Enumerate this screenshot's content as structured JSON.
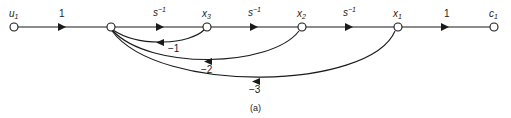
{
  "diagram": {
    "type": "signal-flow-graph",
    "caption": "(a)",
    "nodes": [
      {
        "id": "u1",
        "label": "u",
        "sub": "1",
        "x": 14,
        "y": 27
      },
      {
        "id": "n0",
        "label": "",
        "sub": "",
        "x": 111,
        "y": 27
      },
      {
        "id": "x3",
        "label": "x",
        "sub": "3",
        "x": 207,
        "y": 27
      },
      {
        "id": "x2",
        "label": "x",
        "sub": "2",
        "x": 302,
        "y": 27
      },
      {
        "id": "x1",
        "label": "x",
        "sub": "1",
        "x": 398,
        "y": 27
      },
      {
        "id": "c1",
        "label": "c",
        "sub": "1",
        "x": 494,
        "y": 27
      }
    ],
    "forward_edges": [
      {
        "from": "u1",
        "to": "n0",
        "gain": "1"
      },
      {
        "from": "n0",
        "to": "x3",
        "gain": "s",
        "gain_sup": "−1"
      },
      {
        "from": "x3",
        "to": "x2",
        "gain": "s",
        "gain_sup": "−1"
      },
      {
        "from": "x2",
        "to": "x1",
        "gain": "s",
        "gain_sup": "−1"
      },
      {
        "from": "x1",
        "to": "c1",
        "gain": "1"
      }
    ],
    "feedback_edges": [
      {
        "from": "x3",
        "to": "n0",
        "gain": "−1"
      },
      {
        "from": "x2",
        "to": "n0",
        "gain": "−2"
      },
      {
        "from": "x1",
        "to": "n0",
        "gain": "−3"
      }
    ]
  }
}
